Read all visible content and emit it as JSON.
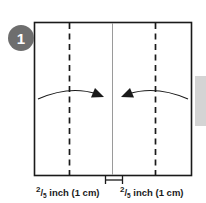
{
  "figure": {
    "step_badge": {
      "number": "1",
      "color": "#6e6e6e",
      "text_color": "#ffffff"
    },
    "sheet": {
      "name": "paper-sheet",
      "outline_color": "#1a1a1a",
      "fill_color": "#ffffff",
      "x": 34,
      "y": 22,
      "width": 158,
      "height": 154
    },
    "fold_lines": [
      {
        "id": "left-fold-line",
        "style": "dashed",
        "x": 69,
        "color": "#1a1a1a"
      },
      {
        "id": "right-fold-line",
        "style": "dashed",
        "x": 155,
        "color": "#1a1a1a"
      }
    ],
    "center_line": {
      "id": "center-line",
      "style": "solid",
      "x": 112,
      "color": "#9a9a9a"
    },
    "arrows": [
      {
        "id": "left-fold-arrow",
        "direction": "right",
        "from_x": 38,
        "to_x": 103,
        "y": 96
      },
      {
        "id": "right-fold-arrow",
        "direction": "left",
        "from_x": 188,
        "to_x": 121,
        "y": 96
      }
    ],
    "measure_bracket": {
      "id": "center-gap-bracket",
      "x1": 105,
      "x2": 123,
      "y": 180
    },
    "dimension_labels": [
      {
        "id": "left-dimension-label",
        "numerator": "2",
        "denominator": "5",
        "text": " inch (1 cm)",
        "full_text": "2/5 inch (1 cm)"
      },
      {
        "id": "right-dimension-label",
        "numerator": "2",
        "denominator": "5",
        "text": " inch (1 cm)",
        "full_text": "2/5 inch (1 cm)"
      }
    ],
    "side_tab": {
      "id": "page-edge-tab",
      "color": "#d4d4d4",
      "x": 195,
      "y": 76,
      "width": 11,
      "height": 50
    }
  }
}
